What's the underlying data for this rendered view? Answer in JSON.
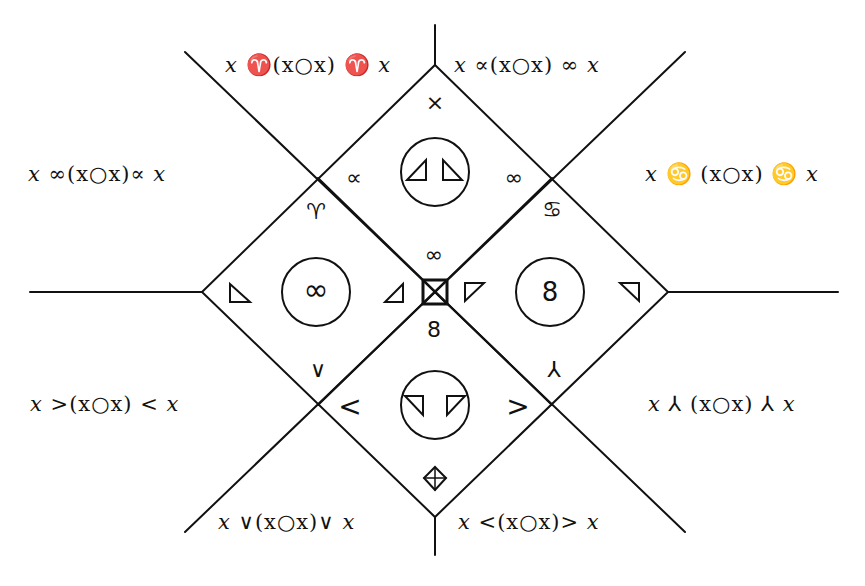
{
  "diagram": {
    "type": "operator-symmetry-lattice",
    "stroke_color": "#111111",
    "background": "#ffffff",
    "outer_labels": {
      "top_left": [
        "x",
        " ♈ ",
        "(",
        "x",
        "○",
        "x",
        ")",
        " ♈ ",
        "x"
      ],
      "top_left_text": "x ♈ (x○x) ♈ x",
      "top_right_text": "x ∝ (x○x) ∞ x",
      "left_upper_text": "x ∞ (x○x) ∝ x",
      "right_upper_text": "x ♋ (x○x) ♋ x",
      "left_lower_text": "x > (x○x) < x",
      "right_lower_text": "x ⅄ (x○x) ⅄ x",
      "bottom_left_text": "x ∨ (x○x) ∨ x",
      "bottom_right_text": "x < (x○x) > x"
    },
    "labels": {
      "top_left": {
        "pre": "x",
        "op1": "♈",
        "mid": "(x○x)",
        "op2": "♈",
        "post": "x"
      },
      "top_right": {
        "pre": "x",
        "op1": "∝",
        "mid": "(x○x)",
        "op2": "∞",
        "post": "x"
      },
      "left_upper": {
        "pre": "x",
        "op1": "∞",
        "mid": "(x○x)",
        "op2": "∝",
        "post": "x"
      },
      "right_upper": {
        "pre": "x",
        "op1": "♋",
        "mid": "(x○x)",
        "op2": "♋",
        "post": "x"
      },
      "left_lower": {
        "pre": "x",
        "op1": ">",
        "mid": "(x○x)",
        "op2": "<",
        "post": "x"
      },
      "right_lower": {
        "pre": "x",
        "op1": "⅄",
        "mid": "(x○x)",
        "op2": "⅄",
        "post": "x"
      },
      "bottom_left": {
        "pre": "x",
        "op1": "∨",
        "mid": "(x○x)",
        "op2": "∨",
        "post": "x"
      },
      "bottom_right": {
        "pre": "x",
        "op1": "<",
        "mid": "(x○x)",
        "op2": ">",
        "post": "x"
      }
    },
    "inner_symbols": {
      "top_cross": "×",
      "top_left_edge": "∝",
      "top_right_edge": "∞",
      "upper_left_aries": "♈",
      "upper_right_loop": "♋",
      "center_above": "∞",
      "center_below": "8",
      "lower_left_vee": "∨",
      "lower_right_lambda": "⅄",
      "bottom_left_lt": "<",
      "bottom_right_gt": ">"
    },
    "circles": {
      "top": {
        "content": "two triangles (◿ ◺ mirrored)",
        "glyph_left": "◿",
        "glyph_right": "◺"
      },
      "left": {
        "content": "∞"
      },
      "right": {
        "content": "8"
      },
      "bottom": {
        "content": "two inverted triangles",
        "glyph_left": "◹",
        "glyph_right": "◸"
      }
    },
    "center_glyph": "⊠",
    "bottom_glyph": "⊕ in diamond"
  }
}
